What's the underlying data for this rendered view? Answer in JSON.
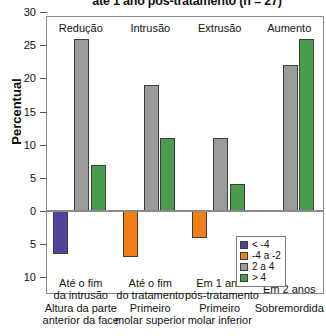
{
  "chart_data": {
    "type": "bar",
    "title": "até 1 ano pós-tratamento (n = 27)",
    "xlabel": "",
    "ylabel": "Percentual",
    "ylim": [
      -11,
      30
    ],
    "yticks": [
      30,
      25,
      20,
      15,
      10,
      5,
      0,
      5,
      10
    ],
    "grid": false,
    "legend_position": "bottom-right",
    "categories": [
      "Altura da parte anterior da face",
      "Primeiro molar superior",
      "Primeiro molar inferior",
      "Sobremordida"
    ],
    "category_lines": [
      [
        "Altura da parte",
        "anterior da face"
      ],
      [
        "Primeiro",
        "molar superior"
      ],
      [
        "Primeiro",
        "molar inferior"
      ],
      [
        "Sobremordida",
        ""
      ]
    ],
    "period_labels": [
      [
        "Até o fim",
        "da intrusão"
      ],
      [
        "Até o fim",
        "do tratamento"
      ],
      [
        "Em 1 ano",
        "pós-tratamento"
      ],
      [
        "Em 2 anos",
        ""
      ]
    ],
    "group_captions": [
      "Redução",
      "Intrusão",
      "Extrusão",
      "Aumento"
    ],
    "series": [
      {
        "name": "< -4",
        "color": "#51459B",
        "values": [
          -6.5,
          0,
          0,
          0
        ]
      },
      {
        "name": "-4 a -2",
        "color": "#F07F1A",
        "values": [
          0,
          -7.0,
          -4.0,
          0
        ]
      },
      {
        "name": "2 a 4",
        "color": "#9B9B9B",
        "values": [
          26.0,
          19.0,
          11.0,
          22.0
        ]
      },
      {
        "name": "> 4",
        "color": "#4A9B4D",
        "values": [
          7.0,
          11.0,
          4.0,
          26.0
        ]
      }
    ]
  },
  "legend": {
    "items": [
      {
        "label": "< -4",
        "color": "#51459B"
      },
      {
        "label": "-4 a -2",
        "color": "#F07F1A"
      },
      {
        "label": "2 a 4",
        "color": "#9B9B9B"
      },
      {
        "label": "> 4",
        "color": "#4A9B4D"
      }
    ]
  },
  "axis": {
    "y_tick_labels": [
      "30",
      "25",
      "20",
      "15",
      "10",
      "5",
      "0",
      "5",
      "10"
    ],
    "y_label": "Percentual"
  }
}
